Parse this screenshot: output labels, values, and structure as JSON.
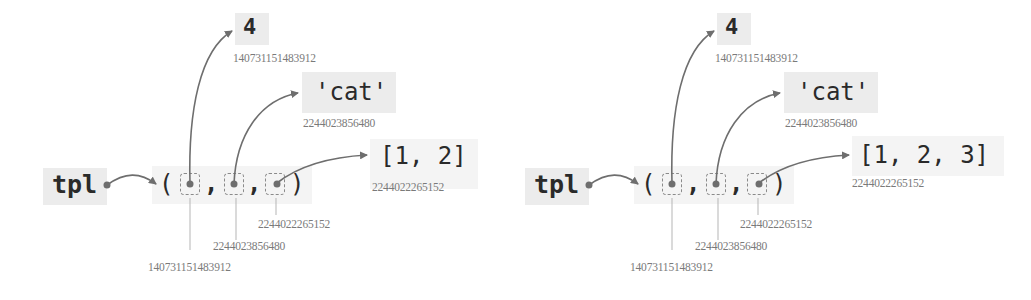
{
  "diagrams": [
    {
      "variable": "tpl",
      "tuple": {
        "open": "(",
        "close": ")",
        "separator": ",",
        "cell_ids": [
          "140731151483912",
          "2244023856480",
          "2244022265152"
        ]
      },
      "objects": [
        {
          "value": "4",
          "id": "140731151483912"
        },
        {
          "value": "'cat'",
          "id": "2244023856480"
        },
        {
          "value": "[1, 2]",
          "id": "2244022265152"
        }
      ]
    },
    {
      "variable": "tpl",
      "tuple": {
        "open": "(",
        "close": ")",
        "separator": ",",
        "cell_ids": [
          "140731151483912",
          "2244023856480",
          "2244022265152"
        ]
      },
      "objects": [
        {
          "value": "4",
          "id": "140731151483912"
        },
        {
          "value": "'cat'",
          "id": "2244023856480"
        },
        {
          "value": "[1, 2, 3]",
          "id": "2244022265152"
        }
      ]
    }
  ],
  "colors": {
    "box": "#ececec",
    "line": "#6e6e6e",
    "address": "#7a7a7a",
    "text": "#2a2a2a"
  }
}
